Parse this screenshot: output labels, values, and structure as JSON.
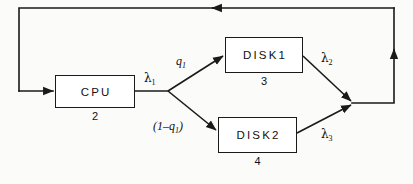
{
  "diagram": {
    "type": "queueing-network-flow-diagram",
    "title": "",
    "nodes": [
      {
        "id": "cpu",
        "label": "CPU",
        "index": "2",
        "x": 55,
        "y": 75,
        "w": 80,
        "h": 33
      },
      {
        "id": "disk1",
        "label": "DISK1",
        "index": "3",
        "x": 225,
        "y": 37,
        "w": 78,
        "h": 36
      },
      {
        "id": "disk2",
        "label": "DISK2",
        "index": "4",
        "x": 218,
        "y": 117,
        "w": 79,
        "h": 36
      }
    ],
    "edge_labels": [
      {
        "id": "lambda1",
        "text": "λ",
        "sub": "1",
        "italic": false,
        "x": 144,
        "y": 72
      },
      {
        "id": "q1",
        "text": "q",
        "sub": "1",
        "italic": true,
        "x": 176,
        "y": 55
      },
      {
        "id": "one-minus-q1",
        "text": "(1–q",
        "sub": "1",
        "suffix": ")",
        "italic": true,
        "x": 153,
        "y": 120
      },
      {
        "id": "lambda2",
        "text": "λ",
        "sub": "2",
        "italic": false,
        "x": 321,
        "y": 52
      },
      {
        "id": "lambda3",
        "text": "λ",
        "sub": "3",
        "italic": false,
        "x": 321,
        "y": 128
      }
    ],
    "colors": {
      "stroke": "#1a1a1a",
      "text": "#111111",
      "background": "#fbfbfa",
      "node_fill": "#ffffff"
    },
    "stroke_width": 1.6
  }
}
